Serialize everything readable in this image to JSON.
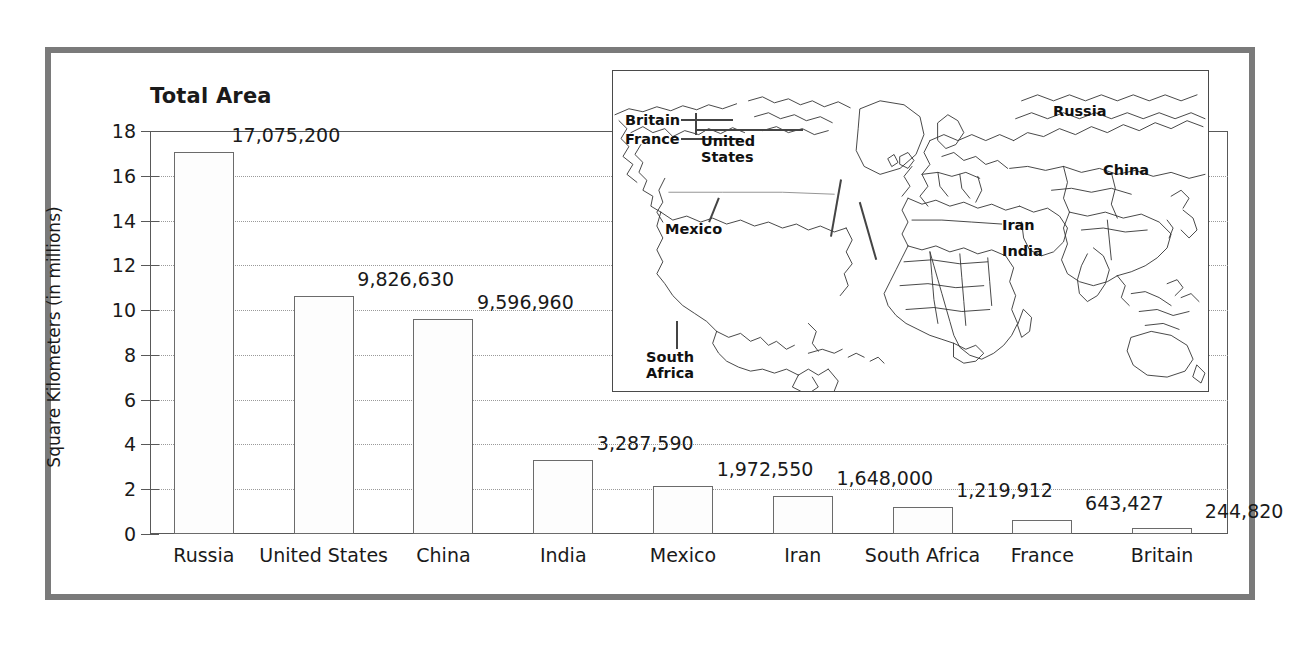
{
  "chart_data": {
    "type": "bar",
    "title": "Total Area",
    "xlabel": "",
    "ylabel": "Square Kilometers (in millions)",
    "ylim": [
      0,
      18
    ],
    "ytick_step": 2,
    "yticks": [
      "0",
      "2",
      "4",
      "6",
      "8",
      "10",
      "12",
      "14",
      "16",
      "18"
    ],
    "grid": true,
    "legend": "none",
    "units": "square kilometers",
    "categories": [
      "Russia",
      "United States",
      "China",
      "India",
      "Mexico",
      "Iran",
      "South Africa",
      "France",
      "Britain"
    ],
    "values": [
      17075200,
      9826630,
      9596960,
      3287590,
      1972550,
      1648000,
      1219912,
      643427,
      244820
    ],
    "value_labels": [
      "17,075,200",
      "9,826,630",
      "9,596,960",
      "3,287,590",
      "1,972,550",
      "1,648,000",
      "1,219,912",
      "643,427",
      "244,820"
    ],
    "values_millions": [
      17.08,
      10.62,
      9.6,
      3.29,
      2.15,
      1.72,
      1.22,
      0.64,
      0.25
    ]
  },
  "map_inset": {
    "name": "world-map",
    "labels": [
      {
        "text": "United States",
        "lines": [
          "United",
          "States"
        ]
      },
      {
        "text": "Mexico",
        "lines": [
          "Mexico"
        ]
      },
      {
        "text": "Britain",
        "lines": [
          "Britain"
        ]
      },
      {
        "text": "France",
        "lines": [
          "France"
        ]
      },
      {
        "text": "Russia",
        "lines": [
          "Russia"
        ]
      },
      {
        "text": "China",
        "lines": [
          "China"
        ]
      },
      {
        "text": "Iran",
        "lines": [
          "Iran"
        ]
      },
      {
        "text": "India",
        "lines": [
          "India"
        ]
      },
      {
        "text": "South Africa",
        "lines": [
          "South",
          "Africa"
        ]
      }
    ],
    "label_united_states_l1": "United",
    "label_united_states_l2": "States",
    "label_mexico": "Mexico",
    "label_britain": "Britain",
    "label_france": "France",
    "label_russia": "Russia",
    "label_china": "China",
    "label_iran": "Iran",
    "label_india": "India",
    "label_south_africa_l1": "South",
    "label_south_africa_l2": "Africa"
  },
  "colors": {
    "frame": "#7a7a7a",
    "axis": "#595959",
    "grid": "#9a9a9a",
    "bar_fill": "#fdfdfd",
    "bar_stroke": "#6b6b6b",
    "text": "#1a1a1a",
    "map_stroke": "#333333"
  }
}
